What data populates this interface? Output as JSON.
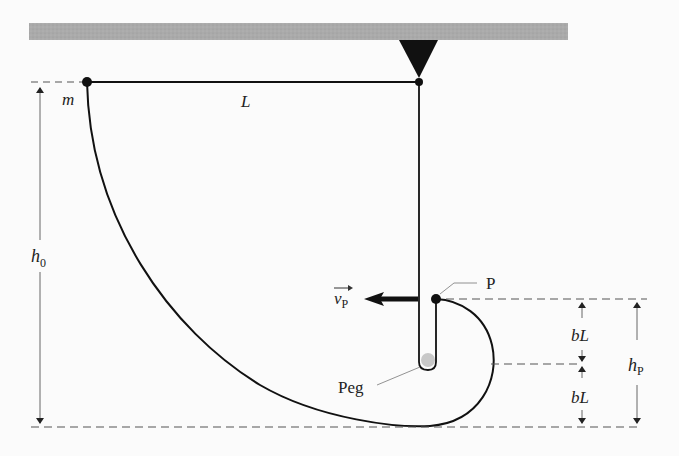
{
  "diagram": {
    "labels": {
      "mass": "m",
      "length": "L",
      "initial_height": "h",
      "initial_height_sub": "0",
      "point": "P",
      "velocity": "v",
      "velocity_sub": "P",
      "peg": "Peg",
      "upper_segment": "bL",
      "lower_segment": "bL",
      "point_height": "h",
      "point_height_sub": "P"
    },
    "colors": {
      "ceiling": "#a9a9a9",
      "line": "#111111",
      "dim_line": "#666666",
      "peg": "#c8c8c8"
    }
  }
}
